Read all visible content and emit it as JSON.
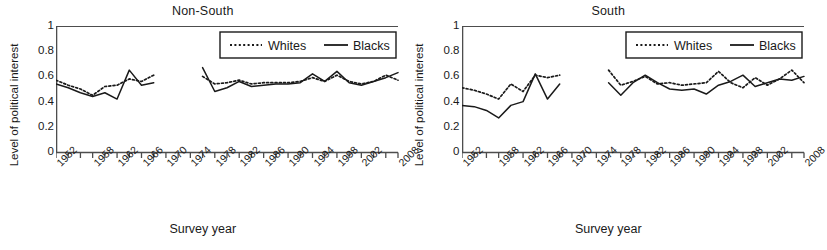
{
  "figure": {
    "panels": [
      {
        "id": "non-south",
        "title": "Non-South",
        "xlabel": "Survey year",
        "ylabel": "Level of political interest"
      },
      {
        "id": "south",
        "title": "South",
        "xlabel": "Survey year",
        "ylabel": "Level of political interest"
      }
    ],
    "legend": {
      "whites_label": "Whites",
      "blacks_label": "Blacks",
      "whites_style": "dotted",
      "blacks_style": "solid"
    },
    "colors": {
      "ink": "#1a1a1a",
      "axis": "#4d4d4d",
      "background": "#ffffff"
    }
  },
  "chart_data": [
    {
      "type": "line",
      "title": "Non-South",
      "xlabel": "Survey year",
      "ylabel": "Level of political interest",
      "ylim": [
        0,
        1
      ],
      "yticks": [
        0,
        0.2,
        0.4,
        0.6,
        0.8,
        1
      ],
      "ytick_labels": [
        "0",
        "0.2",
        "0.4",
        "0.6",
        "0.8",
        "1"
      ],
      "xlim": [
        1952,
        2008
      ],
      "xticks": [
        1952,
        1954,
        1956,
        1958,
        1960,
        1962,
        1964,
        1966,
        1968,
        1970,
        1972,
        1974,
        1976,
        1978,
        1980,
        1982,
        1984,
        1986,
        1988,
        1990,
        1992,
        1994,
        1996,
        1998,
        2000,
        2002,
        2004,
        2006,
        2008
      ],
      "xtick_labels": [
        "1952",
        "1958",
        "1962",
        "1966",
        "1970",
        "1974",
        "1978",
        "1982",
        "1986",
        "1990",
        "1994",
        "1998",
        "2002",
        "2008"
      ],
      "xtick_label_years": [
        1952,
        1958,
        1962,
        1966,
        1970,
        1974,
        1978,
        1982,
        1986,
        1990,
        1994,
        1998,
        2002,
        2008
      ],
      "grid": false,
      "legend_position": "top-right",
      "data_gap_years": [
        1970,
        1972,
        1974
      ],
      "series": [
        {
          "name": "Whites",
          "style": "dotted",
          "x": [
            1952,
            1954,
            1956,
            1958,
            1960,
            1962,
            1964,
            1966,
            1968,
            1976,
            1978,
            1980,
            1982,
            1984,
            1986,
            1988,
            1990,
            1992,
            1994,
            1996,
            1998,
            2000,
            2002,
            2004,
            2006,
            2008
          ],
          "values": [
            0.57,
            0.53,
            0.5,
            0.45,
            0.52,
            0.53,
            0.58,
            0.56,
            0.61,
            0.6,
            0.54,
            0.55,
            0.57,
            0.54,
            0.55,
            0.55,
            0.55,
            0.56,
            0.59,
            0.56,
            0.61,
            0.56,
            0.54,
            0.56,
            0.61,
            0.57
          ]
        },
        {
          "name": "Blacks",
          "style": "solid",
          "x": [
            1952,
            1954,
            1956,
            1958,
            1960,
            1962,
            1964,
            1966,
            1968,
            1976,
            1978,
            1980,
            1982,
            1984,
            1986,
            1988,
            1990,
            1992,
            1994,
            1996,
            1998,
            2000,
            2002,
            2004,
            2006,
            2008
          ],
          "values": [
            0.54,
            0.51,
            0.47,
            0.44,
            0.47,
            0.42,
            0.65,
            0.53,
            0.55,
            0.67,
            0.48,
            0.51,
            0.56,
            0.52,
            0.53,
            0.54,
            0.54,
            0.55,
            0.62,
            0.56,
            0.64,
            0.55,
            0.53,
            0.56,
            0.59,
            0.63
          ]
        }
      ]
    },
    {
      "type": "line",
      "title": "South",
      "xlabel": "Survey year",
      "ylabel": "Level of political interest",
      "ylim": [
        0,
        1
      ],
      "yticks": [
        0,
        0.2,
        0.4,
        0.6,
        0.8,
        1
      ],
      "ytick_labels": [
        "0",
        "0.2",
        "0.4",
        "0.6",
        "0.8",
        "1"
      ],
      "xlim": [
        1952,
        2008
      ],
      "xticks": [
        1952,
        1954,
        1956,
        1958,
        1960,
        1962,
        1964,
        1966,
        1968,
        1970,
        1972,
        1974,
        1976,
        1978,
        1980,
        1982,
        1984,
        1986,
        1988,
        1990,
        1992,
        1994,
        1996,
        1998,
        2000,
        2002,
        2004,
        2006,
        2008
      ],
      "xtick_labels": [
        "1952",
        "1958",
        "1962",
        "1966",
        "1970",
        "1974",
        "1978",
        "1982",
        "1986",
        "1990",
        "1994",
        "1998",
        "2002",
        "2008"
      ],
      "xtick_label_years": [
        1952,
        1958,
        1962,
        1966,
        1970,
        1974,
        1978,
        1982,
        1986,
        1990,
        1994,
        1998,
        2002,
        2008
      ],
      "grid": false,
      "legend_position": "top-right",
      "data_gap_years": [
        1970,
        1972,
        1974
      ],
      "series": [
        {
          "name": "Whites",
          "style": "dotted",
          "x": [
            1952,
            1954,
            1956,
            1958,
            1960,
            1962,
            1964,
            1966,
            1968,
            1976,
            1978,
            1980,
            1982,
            1984,
            1986,
            1988,
            1990,
            1992,
            1994,
            1996,
            1998,
            2000,
            2002,
            2004,
            2006,
            2008
          ],
          "values": [
            0.51,
            0.49,
            0.46,
            0.42,
            0.54,
            0.48,
            0.61,
            0.59,
            0.61,
            0.65,
            0.53,
            0.56,
            0.6,
            0.54,
            0.55,
            0.53,
            0.54,
            0.55,
            0.64,
            0.55,
            0.51,
            0.59,
            0.53,
            0.58,
            0.65,
            0.55
          ]
        },
        {
          "name": "Blacks",
          "style": "solid",
          "x": [
            1952,
            1954,
            1956,
            1958,
            1960,
            1962,
            1964,
            1966,
            1968,
            1976,
            1978,
            1980,
            1982,
            1984,
            1986,
            1988,
            1990,
            1992,
            1994,
            1996,
            1998,
            2000,
            2002,
            2004,
            2006,
            2008
          ],
          "values": [
            0.37,
            0.36,
            0.33,
            0.27,
            0.37,
            0.4,
            0.62,
            0.42,
            0.54,
            0.55,
            0.45,
            0.55,
            0.61,
            0.55,
            0.5,
            0.49,
            0.5,
            0.46,
            0.53,
            0.56,
            0.61,
            0.52,
            0.55,
            0.58,
            0.57,
            0.6
          ]
        }
      ]
    }
  ]
}
